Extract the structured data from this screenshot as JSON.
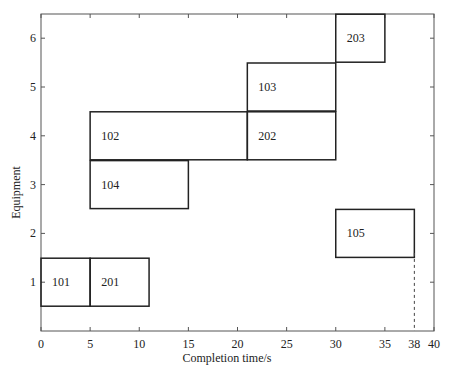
{
  "chart_data": {
    "type": "gantt",
    "title": "",
    "xlabel": "Completion time/s",
    "ylabel": "Equipment",
    "xlim": [
      0,
      40
    ],
    "ylim": [
      0,
      6.5
    ],
    "xticks": [
      0,
      5,
      10,
      15,
      20,
      25,
      30,
      35,
      38,
      40
    ],
    "yticks": [
      1,
      2,
      3,
      4,
      5,
      6
    ],
    "tasks": [
      {
        "label": "101",
        "equipment": 1,
        "start": 0,
        "end": 5
      },
      {
        "label": "201",
        "equipment": 1,
        "start": 5,
        "end": 11
      },
      {
        "label": "104",
        "equipment": 3,
        "start": 5,
        "end": 15
      },
      {
        "label": "102",
        "equipment": 4,
        "start": 5,
        "end": 21
      },
      {
        "label": "202",
        "equipment": 4,
        "start": 21,
        "end": 30
      },
      {
        "label": "103",
        "equipment": 5,
        "start": 21,
        "end": 30
      },
      {
        "label": "203",
        "equipment": 6,
        "start": 30,
        "end": 35
      },
      {
        "label": "105",
        "equipment": 2,
        "start": 30,
        "end": 38
      }
    ],
    "annotations": [
      {
        "type": "dashed-vline",
        "x": 38,
        "from_y": 0,
        "to_y": 1.6,
        "label": "38"
      }
    ],
    "grid": false,
    "legend": null
  }
}
